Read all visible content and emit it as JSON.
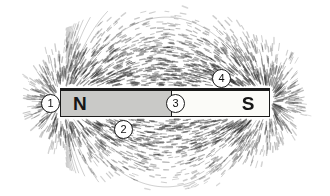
{
  "figure": {
    "background_color": "#ffffff",
    "width": 330,
    "height": 196
  },
  "magnet": {
    "north": {
      "label": "N",
      "fill_color": "#c9c9c7",
      "x": 60,
      "y": 88,
      "w": 112,
      "h": 29
    },
    "south": {
      "label": "S",
      "fill_color": "#fbfbf8",
      "x": 172,
      "y": 88,
      "w": 98,
      "h": 29
    },
    "outline_color": "#1b1b1b"
  },
  "callouts": [
    {
      "number": "1",
      "x": 41,
      "y": 94,
      "target": "north-pole-end"
    },
    {
      "number": "2",
      "x": 114,
      "y": 120,
      "target": "field-lines-below-north"
    },
    {
      "number": "3",
      "x": 166,
      "y": 94,
      "target": "magnet-midpoint-neutral-zone"
    },
    {
      "number": "4",
      "x": 212,
      "y": 69,
      "target": "field-lines-above-south"
    }
  ],
  "field": {
    "filings_color": "#3a3a3a",
    "description": "Iron filings aligned along magnetic field lines looping from N pole to S pole",
    "pole_centers": [
      {
        "name": "north",
        "x": 62,
        "y": 102
      },
      {
        "name": "south",
        "x": 268,
        "y": 102
      }
    ]
  }
}
